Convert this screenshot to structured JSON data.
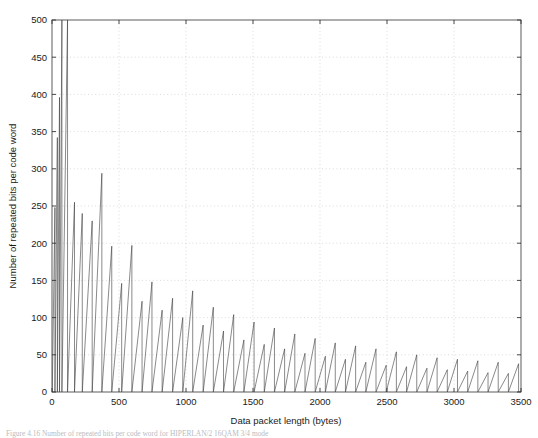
{
  "figure": {
    "background": "#ffffff",
    "caption": "Figure 4.16   Number of repeated bits per code word for HIPERLAN/2 16QAM 3/4 mode"
  },
  "chart_data": {
    "type": "line",
    "title": "",
    "xlabel": "Data packet length (bytes)",
    "ylabel": "Number of repeated bits per code word",
    "xlim": [
      0,
      3500
    ],
    "ylim": [
      0,
      500
    ],
    "xticks": [
      0,
      500,
      1000,
      1500,
      2000,
      2500,
      3000,
      3500
    ],
    "yticks": [
      0,
      50,
      100,
      150,
      200,
      250,
      300,
      350,
      400,
      450,
      500
    ],
    "grid": true,
    "grid_style": "dotted",
    "grid_color": "#cccccc",
    "line_color": "#3a3a3a",
    "line_width": 0.6,
    "legend": null,
    "series": [
      {
        "name": "repeated bits per code word",
        "description": "Sawtooth: padding bits required to fill an integer number of code words; each tooth ramps up linearly then drops vertically to zero. Tooth period grows and peak amplitude decays with packet length.",
        "teeth": [
          {
            "start": 2,
            "peak_x": 22,
            "peak_y": 248
          },
          {
            "start": 22,
            "peak_x": 40,
            "peak_y": 342
          },
          {
            "start": 40,
            "peak_x": 56,
            "peak_y": 396
          },
          {
            "start": 56,
            "peak_x": 74,
            "peak_y": 500
          },
          {
            "start": 74,
            "peak_x": 116,
            "peak_y": 500
          },
          {
            "start": 116,
            "peak_x": 168,
            "peak_y": 255
          },
          {
            "start": 168,
            "peak_x": 226,
            "peak_y": 240
          },
          {
            "start": 226,
            "peak_x": 300,
            "peak_y": 230
          },
          {
            "start": 300,
            "peak_x": 372,
            "peak_y": 294
          },
          {
            "start": 372,
            "peak_x": 446,
            "peak_y": 196
          },
          {
            "start": 446,
            "peak_x": 520,
            "peak_y": 146
          },
          {
            "start": 520,
            "peak_x": 596,
            "peak_y": 197
          },
          {
            "start": 596,
            "peak_x": 672,
            "peak_y": 122
          },
          {
            "start": 672,
            "peak_x": 746,
            "peak_y": 148
          },
          {
            "start": 746,
            "peak_x": 822,
            "peak_y": 110
          },
          {
            "start": 822,
            "peak_x": 900,
            "peak_y": 126
          },
          {
            "start": 900,
            "peak_x": 976,
            "peak_y": 100
          },
          {
            "start": 976,
            "peak_x": 1050,
            "peak_y": 136
          },
          {
            "start": 1050,
            "peak_x": 1128,
            "peak_y": 90
          },
          {
            "start": 1128,
            "peak_x": 1204,
            "peak_y": 114
          },
          {
            "start": 1204,
            "peak_x": 1280,
            "peak_y": 82
          },
          {
            "start": 1280,
            "peak_x": 1356,
            "peak_y": 104
          },
          {
            "start": 1356,
            "peak_x": 1432,
            "peak_y": 70
          },
          {
            "start": 1432,
            "peak_x": 1508,
            "peak_y": 94
          },
          {
            "start": 1508,
            "peak_x": 1584,
            "peak_y": 64
          },
          {
            "start": 1584,
            "peak_x": 1660,
            "peak_y": 86
          },
          {
            "start": 1660,
            "peak_x": 1736,
            "peak_y": 58
          },
          {
            "start": 1736,
            "peak_x": 1812,
            "peak_y": 78
          },
          {
            "start": 1812,
            "peak_x": 1888,
            "peak_y": 52
          },
          {
            "start": 1888,
            "peak_x": 1964,
            "peak_y": 72
          },
          {
            "start": 1964,
            "peak_x": 2040,
            "peak_y": 48
          },
          {
            "start": 2040,
            "peak_x": 2114,
            "peak_y": 66
          },
          {
            "start": 2114,
            "peak_x": 2190,
            "peak_y": 44
          },
          {
            "start": 2190,
            "peak_x": 2266,
            "peak_y": 62
          },
          {
            "start": 2266,
            "peak_x": 2342,
            "peak_y": 40
          },
          {
            "start": 2342,
            "peak_x": 2418,
            "peak_y": 58
          },
          {
            "start": 2418,
            "peak_x": 2494,
            "peak_y": 36
          },
          {
            "start": 2494,
            "peak_x": 2570,
            "peak_y": 54
          },
          {
            "start": 2570,
            "peak_x": 2646,
            "peak_y": 34
          },
          {
            "start": 2646,
            "peak_x": 2722,
            "peak_y": 50
          },
          {
            "start": 2722,
            "peak_x": 2798,
            "peak_y": 32
          },
          {
            "start": 2798,
            "peak_x": 2874,
            "peak_y": 46
          },
          {
            "start": 2874,
            "peak_x": 2950,
            "peak_y": 30
          },
          {
            "start": 2950,
            "peak_x": 3026,
            "peak_y": 44
          },
          {
            "start": 3026,
            "peak_x": 3102,
            "peak_y": 28
          },
          {
            "start": 3102,
            "peak_x": 3178,
            "peak_y": 42
          },
          {
            "start": 3178,
            "peak_x": 3254,
            "peak_y": 26
          },
          {
            "start": 3254,
            "peak_x": 3330,
            "peak_y": 40
          },
          {
            "start": 3330,
            "peak_x": 3406,
            "peak_y": 25
          },
          {
            "start": 3406,
            "peak_x": 3482,
            "peak_y": 38
          }
        ]
      }
    ]
  }
}
